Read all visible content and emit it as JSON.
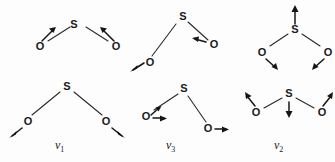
{
  "figure": {
    "title": "",
    "background_color": "#fdfdfd",
    "ink_color": "#1a1a1a",
    "width": 335,
    "height": 162
  },
  "atoms": {
    "sulfur": "S",
    "oxygen": "O"
  },
  "panels": [
    {
      "id": "top-left",
      "mode_label": "",
      "mode_subscript": "",
      "caption": "",
      "atoms": [
        {
          "symbol": "S",
          "x": 60,
          "y": 12
        },
        {
          "symbol": "O",
          "x": 14,
          "y": 34
        },
        {
          "symbol": "O",
          "x": 104,
          "y": 34
        }
      ],
      "arrows": [
        {
          "on": "O-left",
          "direction": "up-right",
          "glyph": "↗"
        },
        {
          "on": "O-right",
          "direction": "up-left",
          "glyph": "↖"
        }
      ]
    },
    {
      "id": "top-middle",
      "mode_label": "",
      "mode_subscript": "",
      "caption": "",
      "atoms": [
        {
          "symbol": "S",
          "x": 54,
          "y": 6
        },
        {
          "symbol": "O",
          "x": 20,
          "y": 54
        },
        {
          "symbol": "O",
          "x": 80,
          "y": 38
        }
      ],
      "arrows": [
        {
          "on": "O-left",
          "direction": "down-left",
          "glyph": "↙"
        },
        {
          "on": "O-right",
          "direction": "left",
          "glyph": "←"
        }
      ]
    },
    {
      "id": "top-right",
      "mode_label": "",
      "mode_subscript": "",
      "caption": "",
      "atoms": [
        {
          "symbol": "S",
          "x": 52,
          "y": 22
        },
        {
          "symbol": "O",
          "x": 14,
          "y": 46
        },
        {
          "symbol": "O",
          "x": 88,
          "y": 46
        }
      ],
      "arrows": [
        {
          "on": "S",
          "direction": "up",
          "glyph": "↑"
        },
        {
          "on": "O-left",
          "direction": "down-right",
          "glyph": "↘"
        },
        {
          "on": "O-right",
          "direction": "down-left",
          "glyph": "↙"
        }
      ]
    },
    {
      "id": "bottom-left",
      "mode_label": "ν",
      "mode_subscript": "1",
      "caption": "ν1",
      "atoms": [
        {
          "symbol": "S",
          "x": 58,
          "y": 6
        },
        {
          "symbol": "O",
          "x": 14,
          "y": 44
        },
        {
          "symbol": "O",
          "x": 100,
          "y": 44
        }
      ],
      "arrows": [
        {
          "on": "O-left",
          "direction": "down-left",
          "glyph": "↙"
        },
        {
          "on": "O-right",
          "direction": "down-right",
          "glyph": "↘"
        }
      ]
    },
    {
      "id": "bottom-middle",
      "mode_label": "ν",
      "mode_subscript": "3",
      "caption": "ν3",
      "atoms": [
        {
          "symbol": "S",
          "x": 52,
          "y": 6
        },
        {
          "symbol": "O",
          "x": 12,
          "y": 36
        },
        {
          "symbol": "O",
          "x": 78,
          "y": 54
        }
      ],
      "arrows": [
        {
          "on": "O-left",
          "direction": "right",
          "glyph": "→"
        },
        {
          "on": "O-right",
          "direction": "right",
          "glyph": "→"
        }
      ]
    },
    {
      "id": "bottom-right",
      "mode_label": "ν",
      "mode_subscript": "2",
      "caption": "ν2",
      "atoms": [
        {
          "symbol": "S",
          "x": 48,
          "y": 8
        },
        {
          "symbol": "O",
          "x": 10,
          "y": 28
        },
        {
          "symbol": "O",
          "x": 84,
          "y": 28
        }
      ],
      "arrows": [
        {
          "on": "S",
          "direction": "down",
          "glyph": "↓"
        },
        {
          "on": "O-left",
          "direction": "up-left",
          "glyph": "↖"
        },
        {
          "on": "O-right",
          "direction": "up-right",
          "glyph": "↗"
        }
      ]
    }
  ],
  "captions": {
    "nu1": {
      "symbol": "ν",
      "sub": "1"
    },
    "nu3": {
      "symbol": "ν",
      "sub": "3"
    },
    "nu2": {
      "symbol": "ν",
      "sub": "2"
    }
  }
}
